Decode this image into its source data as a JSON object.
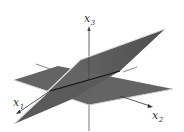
{
  "figure": {
    "type": "3d-planes-intersection",
    "colors": {
      "background": "#ffffff",
      "plane_fill": "#5f5f5f",
      "plane_fill_back": "#7a7a7a",
      "plane_edge": "#d8d8d8",
      "axis": "#444444",
      "intersection_line": "#111111"
    },
    "axes": {
      "x1": {
        "base": "x",
        "sub": "1"
      },
      "x2": {
        "base": "x",
        "sub": "2"
      },
      "x3": {
        "base": "x",
        "sub": "3"
      }
    }
  }
}
